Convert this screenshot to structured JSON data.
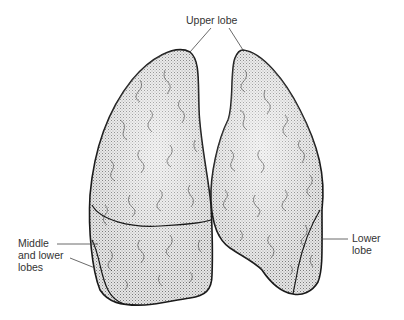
{
  "diagram": {
    "labels": {
      "upper": "Upper lobe",
      "middle_lower_line1": "Middle",
      "middle_lower_line2": "and lower",
      "middle_lower_line3": "lobes",
      "lower_line1": "Lower",
      "lower_line2": "lobe"
    },
    "colors": {
      "outline": "#1a1a1a",
      "fill": "#c8c8c8",
      "text": "#333333"
    }
  }
}
